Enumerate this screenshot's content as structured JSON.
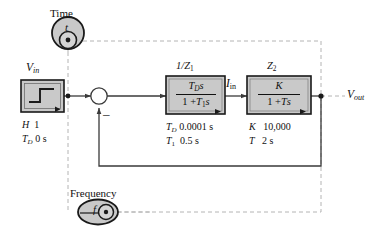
{
  "diagram": {
    "colors": {
      "block_fill": "#c9c9c9",
      "block_stroke": "#1a1a1a",
      "wire": "#3a3a3a",
      "dashed_wire": "#b0b0b0",
      "source_fill": "#c9c9c9",
      "text": "#111111"
    }
  },
  "sources": [
    {
      "id": "time-source",
      "label": "Time",
      "symbol": "t",
      "shape": "circle"
    },
    {
      "id": "frequency-source",
      "label": "Frequency",
      "symbol": "f",
      "shape": "ellipse"
    }
  ],
  "signals": {
    "input": {
      "name": "V",
      "subscript": "in"
    },
    "intermediate": {
      "name": "I",
      "subscript": "in"
    },
    "output": {
      "name": "V",
      "subscript": "out"
    }
  },
  "summing_junction": {
    "id": "summing-junction",
    "feedback_sign": "–"
  },
  "blocks": [
    {
      "id": "step-input-block",
      "caption": {
        "name": "V",
        "subscript": "in"
      },
      "kind": "step-source",
      "parameters": [
        {
          "name": "H",
          "subscript": "",
          "value": "1"
        },
        {
          "name": "T",
          "subscript": "D",
          "value": "0 s"
        }
      ]
    },
    {
      "id": "impedance-inverse-block",
      "caption": {
        "prefix": "1/",
        "name": "Z",
        "subscript": "1"
      },
      "kind": "transfer-function",
      "transfer_function": {
        "numerator": {
          "name": "T",
          "subscript": "D",
          "suffix": "s"
        },
        "denominator": {
          "lead": "1 +",
          "name": "T",
          "subscript": "1",
          "suffix": "s"
        }
      },
      "parameters": [
        {
          "name": "T",
          "subscript": "D",
          "value": "0.0001 s"
        },
        {
          "name": "T",
          "subscript": "1",
          "value": "0.5 s"
        }
      ]
    },
    {
      "id": "impedance-block",
      "caption": {
        "prefix": "",
        "name": "Z",
        "subscript": "2"
      },
      "kind": "transfer-function",
      "transfer_function": {
        "numerator": {
          "name": "K",
          "subscript": "",
          "suffix": ""
        },
        "denominator": {
          "lead": "1 +",
          "name": "T",
          "subscript": "",
          "suffix": "s"
        }
      },
      "parameters": [
        {
          "name": "K",
          "subscript": "",
          "value": "10,000"
        },
        {
          "name": "T",
          "subscript": "",
          "value": "2 s"
        }
      ]
    }
  ]
}
